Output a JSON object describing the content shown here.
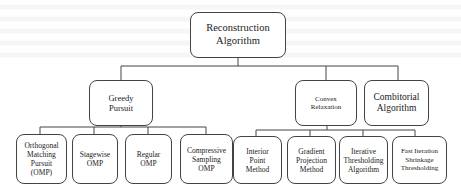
{
  "diagram": {
    "type": "tree",
    "root": {
      "label": "Reconstruction\nAlgorithm",
      "children": [
        {
          "label": "Greedy\nPursuit",
          "children": [
            {
              "label": "Orthogonal\nMatching\nPursuit\n(OMP)"
            },
            {
              "label": "Stagewise\nOMP"
            },
            {
              "label": "Regular\nOMP"
            },
            {
              "label": "Compressive\nSampling\nOMP"
            }
          ]
        },
        {
          "label": "Convex\nRelaxation",
          "children": [
            {
              "label": "Interior\nPoint\nMethod"
            },
            {
              "label": "Gradient\nProjection\nMethod"
            },
            {
              "label": "Iterative\nThresholding\nAlgorithm"
            },
            {
              "label": "Fast Iteration\nShrinkage\nThresholding"
            }
          ]
        },
        {
          "label": "Combitorial\nAlgorithm",
          "children": []
        }
      ]
    },
    "colors": {
      "border": "#444444",
      "background": "#ffffff",
      "text": "#222222"
    }
  }
}
